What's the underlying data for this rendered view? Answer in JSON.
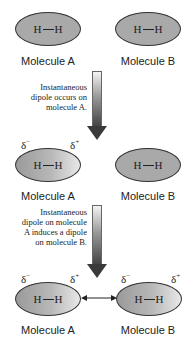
{
  "stages": [
    {
      "molecules": [
        {
          "label": "Molecule A",
          "atoms": [
            "H",
            "H"
          ],
          "polarized": false
        },
        {
          "label": "Molecule B",
          "atoms": [
            "H",
            "H"
          ],
          "polarized": false
        }
      ]
    },
    {
      "transition_note": "Instantaneous dipole occurs on molecule A.",
      "molecules": [
        {
          "label": "Molecule A",
          "atoms": [
            "H",
            "H"
          ],
          "polarized": true,
          "charges": [
            "δ",
            "−",
            "δ",
            "+"
          ]
        },
        {
          "label": "Molecule B",
          "atoms": [
            "H",
            "H"
          ],
          "polarized": false
        }
      ]
    },
    {
      "transition_note": "Instantaneous dipole on molecule A induces a dipole on molecule B.",
      "molecules": [
        {
          "label": "Molecule A",
          "atoms": [
            "H",
            "H"
          ],
          "polarized": true,
          "charges": [
            "δ",
            "−",
            "δ",
            "+"
          ]
        },
        {
          "label": "Molecule B",
          "atoms": [
            "H",
            "H"
          ],
          "polarized": true,
          "charges": [
            "δ",
            "−",
            "δ",
            "+"
          ]
        }
      ],
      "interaction": "double-headed-arrow"
    }
  ],
  "notes": {
    "note1_lines": [
      "Instantaneous",
      "dipole occurs on",
      "molecule A."
    ],
    "note2_lines": [
      "Instantaneous",
      "dipole on molecule",
      "A induces a dipole",
      "on molecule B."
    ]
  },
  "symbols": {
    "atom": "H",
    "delta": "δ",
    "minus": "−",
    "plus": "+"
  }
}
